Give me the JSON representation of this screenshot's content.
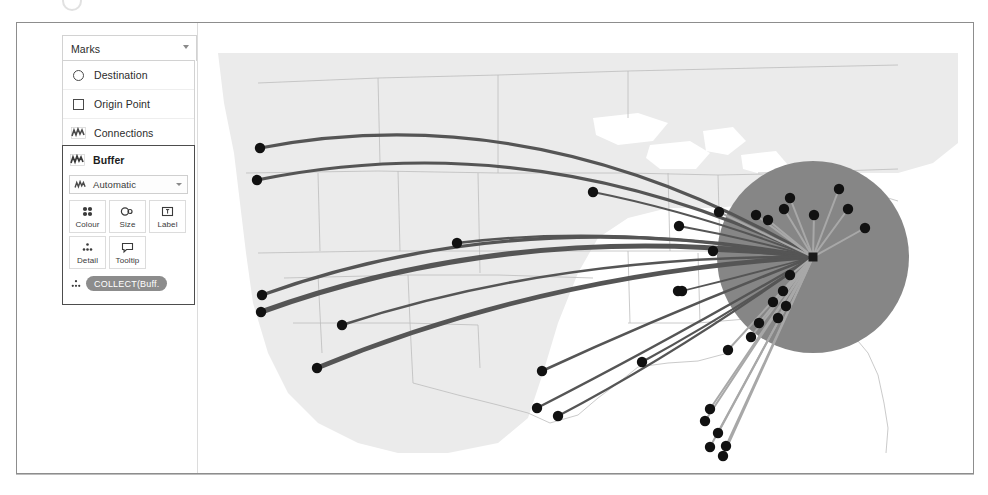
{
  "marks_card": {
    "header_label": "Marks",
    "header_caret_icon": "chevron-down-icon",
    "layers": [
      {
        "label": "Destination",
        "icon": "circle-mark-icon"
      },
      {
        "label": "Origin Point",
        "icon": "square-mark-icon"
      },
      {
        "label": "Connections",
        "icon": "line-map-mark-icon"
      }
    ],
    "active_layer": {
      "title": "Buffer",
      "title_icon": "line-map-mark-icon",
      "mark_type": {
        "value": "Automatic",
        "icon": "line-map-mark-icon",
        "caret_icon": "chevron-down-icon"
      },
      "shelves": [
        {
          "label": "Colour",
          "icon": "colour-palette-icon"
        },
        {
          "label": "Size",
          "icon": "size-icon"
        },
        {
          "label": "Label",
          "icon": "label-icon"
        },
        {
          "label": "Detail",
          "icon": "detail-icon"
        },
        {
          "label": "Tooltip",
          "icon": "tooltip-icon"
        }
      ],
      "pills": [
        {
          "text": "COLLECT(Buff.",
          "icon": "detail-icon",
          "colour": "#8c8c8c"
        }
      ]
    }
  },
  "map": {
    "land_colour": "#ebebeb",
    "border_colour": "#b4b4b4",
    "water_colour": "#ffffff",
    "buffer_circle": {
      "centre_x": 615,
      "centre_y": 234,
      "radius": 96,
      "fill": "#868686"
    },
    "origin_point": {
      "x": 615,
      "y": 234,
      "size": 9,
      "fill": "#1a1a1a",
      "shape": "square"
    },
    "destination_fill": "#111111",
    "connection_colour_dark": "#555555",
    "connection_colour_light": "#a8a8a8",
    "destinations": [
      {
        "x": 62,
        "y": 125
      },
      {
        "x": 59,
        "y": 157
      },
      {
        "x": 64,
        "y": 272
      },
      {
        "x": 63,
        "y": 289
      },
      {
        "x": 144,
        "y": 302
      },
      {
        "x": 119,
        "y": 345
      },
      {
        "x": 259,
        "y": 220
      },
      {
        "x": 344,
        "y": 348
      },
      {
        "x": 395,
        "y": 169
      },
      {
        "x": 481,
        "y": 203
      },
      {
        "x": 484,
        "y": 268
      },
      {
        "x": 515,
        "y": 228
      },
      {
        "x": 339,
        "y": 385
      },
      {
        "x": 360,
        "y": 393
      },
      {
        "x": 444,
        "y": 339
      },
      {
        "x": 480,
        "y": 268
      },
      {
        "x": 521,
        "y": 189
      },
      {
        "x": 558,
        "y": 192
      },
      {
        "x": 570,
        "y": 197
      },
      {
        "x": 586,
        "y": 186
      },
      {
        "x": 592,
        "y": 175
      },
      {
        "x": 616,
        "y": 192
      },
      {
        "x": 650,
        "y": 186
      },
      {
        "x": 667,
        "y": 205
      },
      {
        "x": 641,
        "y": 166
      },
      {
        "x": 592,
        "y": 252
      },
      {
        "x": 585,
        "y": 268
      },
      {
        "x": 575,
        "y": 279
      },
      {
        "x": 580,
        "y": 295
      },
      {
        "x": 588,
        "y": 283
      },
      {
        "x": 561,
        "y": 300
      },
      {
        "x": 553,
        "y": 314
      },
      {
        "x": 530,
        "y": 327
      },
      {
        "x": 512,
        "y": 386
      },
      {
        "x": 507,
        "y": 398
      },
      {
        "x": 520,
        "y": 410
      },
      {
        "x": 528,
        "y": 423
      },
      {
        "x": 525,
        "y": 433
      },
      {
        "x": 512,
        "y": 424
      }
    ]
  }
}
